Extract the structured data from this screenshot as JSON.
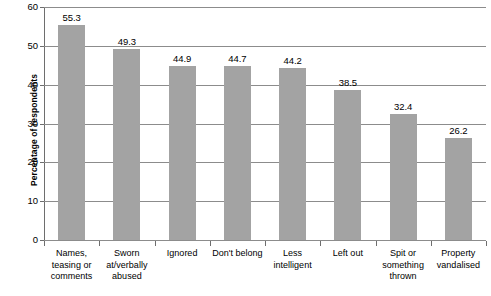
{
  "chart_data": {
    "type": "bar",
    "title": "",
    "xlabel": "",
    "ylabel": "Percentage of respondents",
    "ylim": [
      0,
      60
    ],
    "yticks": [
      0,
      10,
      20,
      30,
      40,
      50,
      60
    ],
    "ytick_labels": [
      "0",
      "10",
      "20",
      "30",
      "40",
      "50",
      "60"
    ],
    "grid": true,
    "legend": "none",
    "bar_color": "#a3a3a3",
    "categories": [
      "Names, teasing or comments",
      "Sworn at/verbally abused",
      "Ignored",
      "Don't belong",
      "Less intelligent",
      "Left out",
      "Spit or something thrown",
      "Property vandalised"
    ],
    "category_lines": [
      [
        "Names,",
        "teasing or",
        "comments"
      ],
      [
        "Sworn",
        "at/verbally",
        "abused"
      ],
      [
        "Ignored"
      ],
      [
        "Don't belong"
      ],
      [
        "Less",
        "intelligent"
      ],
      [
        "Left out"
      ],
      [
        "Spit or",
        "something",
        "thrown"
      ],
      [
        "Property",
        "vandalised"
      ]
    ],
    "values": [
      55.3,
      49.3,
      44.9,
      44.7,
      44.2,
      38.5,
      32.4,
      26.2
    ],
    "value_labels": [
      "55.3",
      "49.3",
      "44.9",
      "44.7",
      "44.2",
      "38.5",
      "32.4",
      "26.2"
    ]
  }
}
